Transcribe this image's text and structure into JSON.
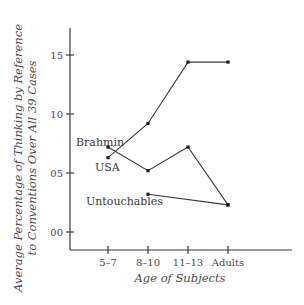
{
  "chart_data": {
    "type": "line",
    "title": "",
    "xlabel": "Age of Subjects",
    "ylabel": "Average Percentage of Thinking by Reference to Conventions Over All 39 Cases",
    "ylabel_lines": [
      "Average Percentage of Thinking by Reference",
      "to Conventions Over All 39 Cases"
    ],
    "categories": [
      "5–7",
      "8–10",
      "11–13",
      "Adults"
    ],
    "yticks": [
      "00",
      "05",
      "10",
      "15"
    ],
    "ytick_values": [
      0,
      5,
      10,
      15
    ],
    "ylim": [
      -1,
      17
    ],
    "grid": false,
    "legend": "inline labels",
    "series": [
      {
        "name": "USA",
        "values": [
          6.3,
          9.2,
          14.4,
          14.4
        ]
      },
      {
        "name": "Brahmin",
        "values": [
          7.2,
          5.2,
          7.2,
          2.3
        ]
      },
      {
        "name": "Untouchables",
        "values": [
          null,
          3.2,
          null,
          2.3
        ]
      }
    ]
  }
}
